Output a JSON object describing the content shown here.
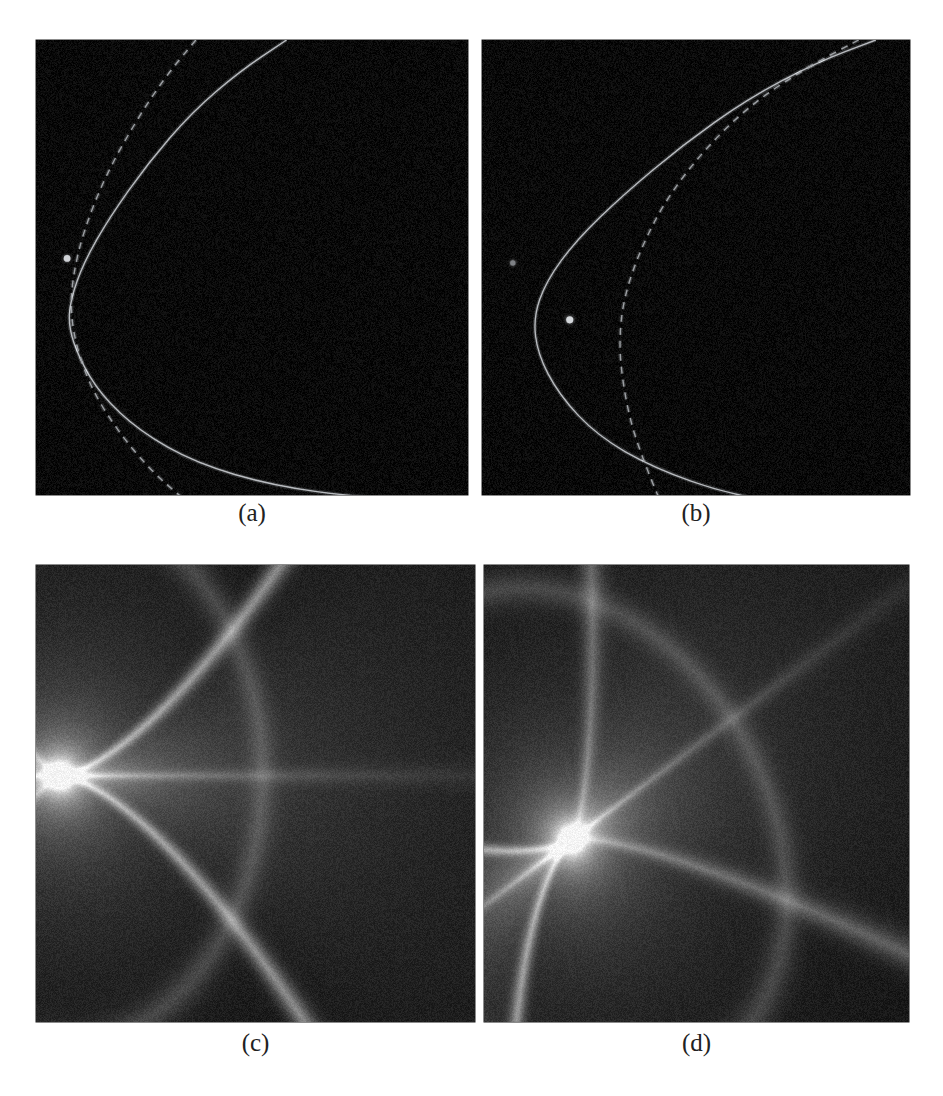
{
  "figure": {
    "background_color": "#ffffff",
    "panel_background_color": "#080808",
    "caption_color": "#222222",
    "layout": {
      "columns": 2,
      "rows": 2,
      "width": 943,
      "height": 1096
    }
  },
  "panels": [
    {
      "id": "panel-a",
      "caption": "(a)",
      "kind": "critical-curves",
      "frame": {
        "x": 36,
        "y": 40,
        "w": 432,
        "h": 455
      },
      "caption_box": {
        "x": 36,
        "y": 500,
        "w": 432,
        "h": 34
      },
      "curves": [
        {
          "name": "solid-critical-curve",
          "style": "solid",
          "color": "#b9bcc0",
          "width": 1.4,
          "points": [
            [
              0.58,
              0.0
            ],
            [
              0.47,
              0.07
            ],
            [
              0.36,
              0.16
            ],
            [
              0.26,
              0.27
            ],
            [
              0.17,
              0.39
            ],
            [
              0.11,
              0.49
            ],
            [
              0.08,
              0.57
            ],
            [
              0.075,
              0.63
            ],
            [
              0.1,
              0.7
            ],
            [
              0.15,
              0.78
            ],
            [
              0.24,
              0.86
            ],
            [
              0.37,
              0.93
            ],
            [
              0.55,
              0.98
            ],
            [
              0.75,
              1.005
            ],
            [
              1.0,
              1.02
            ]
          ]
        },
        {
          "name": "dashed-caustic-curve",
          "style": "dashed",
          "color": "#9da0a4",
          "width": 1.4,
          "dash": "7,6",
          "points": [
            [
              0.37,
              0.0
            ],
            [
              0.3,
              0.08
            ],
            [
              0.23,
              0.18
            ],
            [
              0.16,
              0.3
            ],
            [
              0.11,
              0.42
            ],
            [
              0.085,
              0.52
            ],
            [
              0.08,
              0.6
            ],
            [
              0.095,
              0.68
            ],
            [
              0.13,
              0.77
            ],
            [
              0.19,
              0.86
            ],
            [
              0.26,
              0.94
            ],
            [
              0.33,
              1.0
            ],
            [
              0.41,
              1.06
            ]
          ]
        }
      ],
      "markers": [
        {
          "name": "source-point-bright",
          "x": 0.072,
          "y": 0.48,
          "r": 3.4,
          "color": "#cfd2d6",
          "glow": 7
        }
      ]
    },
    {
      "id": "panel-b",
      "caption": "(b)",
      "kind": "critical-curves",
      "frame": {
        "x": 482,
        "y": 40,
        "w": 428,
        "h": 455
      },
      "caption_box": {
        "x": 482,
        "y": 500,
        "w": 428,
        "h": 34
      },
      "curves": [
        {
          "name": "solid-critical-curve",
          "style": "solid",
          "color": "#b9bcc0",
          "width": 1.4,
          "points": [
            [
              0.92,
              0.0
            ],
            [
              0.78,
              0.05
            ],
            [
              0.62,
              0.13
            ],
            [
              0.47,
              0.23
            ],
            [
              0.33,
              0.34
            ],
            [
              0.22,
              0.44
            ],
            [
              0.15,
              0.53
            ],
            [
              0.12,
              0.61
            ],
            [
              0.13,
              0.69
            ],
            [
              0.18,
              0.78
            ],
            [
              0.27,
              0.87
            ],
            [
              0.4,
              0.94
            ],
            [
              0.58,
              1.0
            ],
            [
              0.8,
              1.03
            ],
            [
              1.0,
              1.05
            ]
          ]
        },
        {
          "name": "dashed-caustic-curve",
          "style": "dashed",
          "color": "#9da0a4",
          "width": 1.4,
          "dash": "7,6",
          "points": [
            [
              0.88,
              0.0
            ],
            [
              0.76,
              0.06
            ],
            [
              0.63,
              0.14
            ],
            [
              0.52,
              0.24
            ],
            [
              0.43,
              0.35
            ],
            [
              0.37,
              0.46
            ],
            [
              0.33,
              0.57
            ],
            [
              0.32,
              0.67
            ],
            [
              0.33,
              0.76
            ],
            [
              0.35,
              0.85
            ],
            [
              0.38,
              0.93
            ],
            [
              0.41,
              1.0
            ],
            [
              0.44,
              1.06
            ]
          ]
        }
      ],
      "markers": [
        {
          "name": "source-point-faint",
          "x": 0.072,
          "y": 0.49,
          "r": 2.6,
          "color": "#7e8185",
          "glow": 6
        },
        {
          "name": "source-point-bright",
          "x": 0.205,
          "y": 0.615,
          "r": 3.6,
          "color": "#d4d7db",
          "glow": 8
        }
      ]
    },
    {
      "id": "panel-c",
      "caption": "(c)",
      "kind": "caustic-intensity-map",
      "frame": {
        "x": 36,
        "y": 565,
        "w": 439,
        "h": 457
      },
      "caption_box": {
        "x": 36,
        "y": 1030,
        "w": 439,
        "h": 34
      },
      "cusp": {
        "x": 0.055,
        "y": 0.46
      },
      "orientation": "cusp-left-arms-right",
      "peak_color": "#ffffff",
      "mid_color": "#9a9a9a",
      "features": [
        "bright-cusp-point-left",
        "upper-fold-arm-sweeping-right",
        "lower-fold-arm-sweeping-right-down",
        "horizontal-bright-ray-through-cusp",
        "faint-secondary-fold"
      ]
    },
    {
      "id": "panel-d",
      "caption": "(d)",
      "kind": "caustic-intensity-map",
      "frame": {
        "x": 484,
        "y": 565,
        "w": 425,
        "h": 457
      },
      "caption_box": {
        "x": 484,
        "y": 1030,
        "w": 425,
        "h": 34
      },
      "cusp": {
        "x": 0.205,
        "y": 0.6
      },
      "orientation": "cusp-center-left-fan-upper-left",
      "peak_color": "#ffffff",
      "mid_color": "#8f8f8f",
      "features": [
        "bright-cusp-point",
        "broad-fan-to-upper-left",
        "fold-arm-to-upper-right",
        "fold-arm-to-lower-left",
        "dark-lane-through-fan"
      ]
    }
  ],
  "chart_data": {
    "type": "scatter",
    "panel_labels": [
      "(a)",
      "(b)",
      "(c)",
      "(d)"
    ],
    "xlabel": "",
    "ylabel": "",
    "grid": false,
    "legend": "none",
    "series": [
      {
        "name": "panel-a-solid-critical-curve",
        "panel": "(a)",
        "style": "solid",
        "color": "#b9bcc0",
        "x": [
          0.58,
          0.47,
          0.36,
          0.26,
          0.17,
          0.11,
          0.08,
          0.075,
          0.1,
          0.15,
          0.24,
          0.37,
          0.55,
          0.75,
          1.0
        ],
        "y": [
          0.0,
          0.07,
          0.16,
          0.27,
          0.39,
          0.49,
          0.57,
          0.63,
          0.7,
          0.78,
          0.86,
          0.93,
          0.98,
          1.005,
          1.02
        ]
      },
      {
        "name": "panel-a-dashed-caustic-curve",
        "panel": "(a)",
        "style": "dashed",
        "color": "#9da0a4",
        "x": [
          0.37,
          0.3,
          0.23,
          0.16,
          0.11,
          0.085,
          0.08,
          0.095,
          0.13,
          0.19,
          0.26,
          0.33,
          0.41
        ],
        "y": [
          0.0,
          0.08,
          0.18,
          0.3,
          0.42,
          0.52,
          0.6,
          0.68,
          0.77,
          0.86,
          0.94,
          1.0,
          1.06
        ]
      },
      {
        "name": "panel-b-solid-critical-curve",
        "panel": "(b)",
        "style": "solid",
        "color": "#b9bcc0",
        "x": [
          0.92,
          0.78,
          0.62,
          0.47,
          0.33,
          0.22,
          0.15,
          0.12,
          0.13,
          0.18,
          0.27,
          0.4,
          0.58,
          0.8,
          1.0
        ],
        "y": [
          0.0,
          0.05,
          0.13,
          0.23,
          0.34,
          0.44,
          0.53,
          0.61,
          0.69,
          0.78,
          0.87,
          0.94,
          1.0,
          1.03,
          1.05
        ]
      },
      {
        "name": "panel-b-dashed-caustic-curve",
        "panel": "(b)",
        "style": "dashed",
        "color": "#9da0a4",
        "x": [
          0.88,
          0.76,
          0.63,
          0.52,
          0.43,
          0.37,
          0.33,
          0.32,
          0.33,
          0.35,
          0.38,
          0.41,
          0.44
        ],
        "y": [
          0.0,
          0.06,
          0.14,
          0.24,
          0.35,
          0.46,
          0.57,
          0.67,
          0.76,
          0.85,
          0.93,
          1.0,
          1.06
        ]
      }
    ],
    "markers": [
      {
        "panel": "(a)",
        "name": "source-point-bright",
        "x": 0.072,
        "y": 0.48
      },
      {
        "panel": "(b)",
        "name": "source-point-faint",
        "x": 0.072,
        "y": 0.49
      },
      {
        "panel": "(b)",
        "name": "source-point-bright",
        "x": 0.205,
        "y": 0.615
      },
      {
        "panel": "(c)",
        "name": "cusp-point",
        "x": 0.055,
        "y": 0.46
      },
      {
        "panel": "(d)",
        "name": "cusp-point",
        "x": 0.205,
        "y": 0.6
      }
    ]
  }
}
